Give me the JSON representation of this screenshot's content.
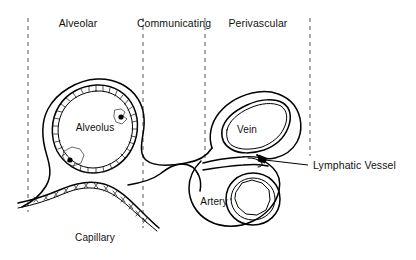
{
  "figure": {
    "background_color": "#ffffff",
    "ink_color": "#000000",
    "divider_color": "#555555",
    "width": 416,
    "height": 260
  },
  "zone_labels": [
    {
      "id": "alveolar",
      "text": "Alveolar",
      "x": 78,
      "y": 27
    },
    {
      "id": "communicating",
      "text": "Communicating",
      "x": 174,
      "y": 27
    },
    {
      "id": "perivascular",
      "text": "Perivascular",
      "x": 258,
      "y": 27
    }
  ],
  "structure_labels": [
    {
      "id": "alveolus",
      "text": "Alveolus",
      "x": 95,
      "y": 131
    },
    {
      "id": "vein",
      "text": "Vein",
      "x": 247,
      "y": 133
    },
    {
      "id": "artery",
      "text": "Artery",
      "x": 214,
      "y": 205
    },
    {
      "id": "capillary",
      "text": "Capillary",
      "x": 95,
      "y": 241
    }
  ],
  "callouts": [
    {
      "id": "lymphatic-vessel",
      "text": "Lymphatic Vessel",
      "x": 313,
      "y": 169,
      "leader_from": {
        "x": 308,
        "y": 165
      },
      "leader_to": {
        "x": 265,
        "y": 160
      }
    }
  ],
  "dividers": [
    {
      "id": "divider-left",
      "x": 28,
      "y1": 18,
      "y2": 212
    },
    {
      "id": "divider-second",
      "x": 143,
      "y1": 18,
      "y2": 228
    },
    {
      "id": "divider-third",
      "x": 205,
      "y1": 18,
      "y2": 160
    },
    {
      "id": "divider-right",
      "x": 310,
      "y1": 18,
      "y2": 156
    }
  ],
  "anatomy": {
    "alveolus_cell_dots": [
      {
        "id": "alveolar-cell-upper-right",
        "x": 121,
        "y": 117,
        "r": 2.6
      },
      {
        "id": "alveolar-cell-lower-left",
        "x": 70,
        "y": 160,
        "r": 2.6
      }
    ],
    "lymphatic_marker": {
      "x": 264,
      "y": 159
    },
    "hatch_description": "bristled capillary endothelium lining",
    "structures": [
      "alveolus",
      "alveolar-capillary",
      "vein",
      "artery",
      "lymphatic-vessel",
      "interstitial-sheath"
    ]
  }
}
